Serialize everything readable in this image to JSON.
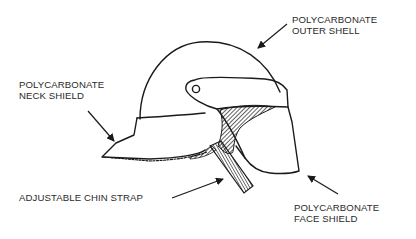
{
  "figure": {
    "line_color": "#1a1a1a",
    "background": "#ffffff",
    "labels": [
      {
        "id": "outer-shell",
        "line1": "POLYCARBONATE",
        "line2": "OUTER SHELL"
      },
      {
        "id": "neck-shield",
        "line1": "POLYCARBONATE",
        "line2": "NECK SHIELD"
      },
      {
        "id": "chin-strap",
        "line1": "ADJUSTABLE CHIN STRAP"
      },
      {
        "id": "face-shield",
        "line1": "POLYCARBONATE",
        "line2": "FACE SHIELD"
      }
    ]
  }
}
